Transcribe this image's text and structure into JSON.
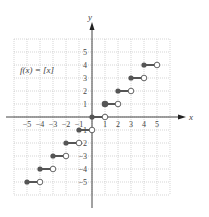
{
  "graph": {
    "function_label": "f(x) = [x]",
    "x_axis_label": "x",
    "y_axis_label": "y",
    "x_ticks": [
      "-5",
      "-4",
      "-3",
      "-2",
      "-1",
      "1",
      "2",
      "3",
      "4",
      "5"
    ],
    "y_ticks": [
      "5",
      "4",
      "3",
      "2",
      "1",
      "-1",
      "-2",
      "-3",
      "-4",
      "-5"
    ],
    "grid_range": [
      -6,
      6
    ],
    "colors": {
      "step": "#555555",
      "grid": "#bbbbbb",
      "axis": "#444444"
    }
  },
  "chart_data": {
    "type": "line",
    "title": "f(x) = [x]",
    "xlabel": "x",
    "ylabel": "y",
    "xlim": [
      -6,
      6
    ],
    "ylim": [
      -6,
      6
    ],
    "grid": true,
    "segments": [
      {
        "x_start": -5,
        "x_end": -4,
        "y": -5,
        "closed_left": true,
        "open_right": true
      },
      {
        "x_start": -4,
        "x_end": -3,
        "y": -4,
        "closed_left": true,
        "open_right": true
      },
      {
        "x_start": -3,
        "x_end": -2,
        "y": -3,
        "closed_left": true,
        "open_right": true
      },
      {
        "x_start": -2,
        "x_end": -1,
        "y": -2,
        "closed_left": true,
        "open_right": true
      },
      {
        "x_start": -1,
        "x_end": 0,
        "y": -1,
        "closed_left": true,
        "open_right": true
      },
      {
        "x_start": 0,
        "x_end": 1,
        "y": 0,
        "closed_left": true,
        "open_right": true
      },
      {
        "x_start": 1,
        "x_end": 2,
        "y": 1,
        "closed_left": true,
        "open_right": true
      },
      {
        "x_start": 2,
        "x_end": 3,
        "y": 2,
        "closed_left": true,
        "open_right": true
      },
      {
        "x_start": 3,
        "x_end": 4,
        "y": 3,
        "closed_left": true,
        "open_right": true
      },
      {
        "x_start": 4,
        "x_end": 5,
        "y": 4,
        "closed_left": true,
        "open_right": true
      }
    ]
  }
}
